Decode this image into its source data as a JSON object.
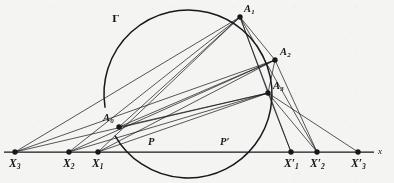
{
  "figure": {
    "background_color": "#f4f4f2",
    "ink_color": "#17181a",
    "circle": {
      "label": "Γ",
      "center_x": 188,
      "center_y": 94,
      "radius": 84,
      "gap_start_deg": 150,
      "gap_end_deg": 171
    },
    "axis": {
      "label": "x",
      "y": 152,
      "x_start": 4,
      "x_end": 374
    },
    "points": [
      {
        "id": "A0",
        "label": "A",
        "sub": "0",
        "x": 119,
        "y": 127,
        "dot": true,
        "label_dx": -16,
        "label_dy": -14,
        "cls": "l-A"
      },
      {
        "id": "A1",
        "label": "A",
        "sub": "1",
        "x": 240,
        "y": 17,
        "dot": true,
        "label_dx": 4,
        "label_dy": -13,
        "cls": "l-A"
      },
      {
        "id": "A2",
        "label": "A",
        "sub": "2",
        "x": 275,
        "y": 60,
        "dot": true,
        "label_dx": 5,
        "label_dy": -13,
        "cls": "l-A"
      },
      {
        "id": "A3",
        "label": "A",
        "sub": "3",
        "x": 268,
        "y": 93,
        "dot": true,
        "label_dx": 5,
        "label_dy": -12,
        "cls": "l-A"
      },
      {
        "id": "X3",
        "label": "X",
        "sub": "3",
        "x": 15,
        "y": 152,
        "dot": true,
        "label_dx": -6,
        "label_dy": 6,
        "cls": "l-X"
      },
      {
        "id": "X2",
        "label": "X",
        "sub": "2",
        "x": 69,
        "y": 152,
        "dot": true,
        "label_dx": -6,
        "label_dy": 6,
        "cls": "l-X"
      },
      {
        "id": "X1",
        "label": "X",
        "sub": "1",
        "x": 98,
        "y": 152,
        "dot": true,
        "label_dx": -6,
        "label_dy": 6,
        "cls": "l-X"
      },
      {
        "id": "X1p",
        "label": "X",
        "sub": "1",
        "prime": "′",
        "x": 291,
        "y": 152,
        "dot": true,
        "label_dx": -7,
        "label_dy": 6,
        "cls": "l-X"
      },
      {
        "id": "X2p",
        "label": "X",
        "sub": "2",
        "prime": "′",
        "x": 317,
        "y": 152,
        "dot": true,
        "label_dx": -7,
        "label_dy": 6,
        "cls": "l-X"
      },
      {
        "id": "X3p",
        "label": "X",
        "sub": "3",
        "prime": "′",
        "x": 358,
        "y": 152,
        "dot": true,
        "label_dx": -7,
        "label_dy": 6,
        "cls": "l-X"
      },
      {
        "id": "P",
        "label": "P",
        "x": 152,
        "y": 152,
        "dot": false,
        "label_dx": -4,
        "label_dy": -15,
        "cls": "l-P"
      },
      {
        "id": "Pp",
        "label": "P",
        "prime": "′",
        "x": 225,
        "y": 152,
        "dot": false,
        "label_dx": -5,
        "label_dy": -15,
        "cls": "l-P"
      }
    ],
    "gamma_label": {
      "text": "Γ",
      "x": 112,
      "y": 14
    },
    "axis_label": {
      "text": "x",
      "x": 378,
      "y": 147
    },
    "segments": [
      {
        "name": "X3-to-A1",
        "x1": 15,
        "y1": 152,
        "x2": 240,
        "y2": 17
      },
      {
        "name": "X2-to-A1",
        "x1": 69,
        "y1": 152,
        "x2": 240,
        "y2": 17
      },
      {
        "name": "X1-to-A1",
        "x1": 98,
        "y1": 152,
        "x2": 240,
        "y2": 17
      },
      {
        "name": "X3-to-A2",
        "x1": 15,
        "y1": 152,
        "x2": 275,
        "y2": 60
      },
      {
        "name": "X2-to-A2",
        "x1": 69,
        "y1": 152,
        "x2": 275,
        "y2": 60
      },
      {
        "name": "X1-to-A2",
        "x1": 98,
        "y1": 152,
        "x2": 275,
        "y2": 60
      },
      {
        "name": "X3-to-A3",
        "x1": 15,
        "y1": 152,
        "x2": 268,
        "y2": 93
      },
      {
        "name": "X2-to-A3",
        "x1": 69,
        "y1": 152,
        "x2": 268,
        "y2": 93
      },
      {
        "name": "X1-to-A3",
        "x1": 98,
        "y1": 152,
        "x2": 268,
        "y2": 93
      },
      {
        "name": "A0-to-A1",
        "x1": 119,
        "y1": 127,
        "x2": 240,
        "y2": 17
      },
      {
        "name": "A0-to-A2",
        "x1": 119,
        "y1": 127,
        "x2": 275,
        "y2": 60
      },
      {
        "name": "A0-to-A3",
        "x1": 119,
        "y1": 127,
        "x2": 268,
        "y2": 93
      },
      {
        "name": "A1-to-A2",
        "x1": 240,
        "y1": 17,
        "x2": 275,
        "y2": 60
      },
      {
        "name": "A1-to-A3",
        "x1": 240,
        "y1": 17,
        "x2": 268,
        "y2": 93
      },
      {
        "name": "A2-to-A3",
        "x1": 275,
        "y1": 60,
        "x2": 268,
        "y2": 93
      },
      {
        "name": "A1-to-X1p",
        "x1": 240,
        "y1": 17,
        "x2": 291,
        "y2": 152
      },
      {
        "name": "A1-to-X2p",
        "x1": 240,
        "y1": 17,
        "x2": 317,
        "y2": 152
      },
      {
        "name": "A2-to-X2p",
        "x1": 275,
        "y1": 60,
        "x2": 317,
        "y2": 152
      },
      {
        "name": "A3-to-X1p",
        "x1": 268,
        "y1": 93,
        "x2": 291,
        "y2": 152
      },
      {
        "name": "A3-to-X2p",
        "x1": 268,
        "y1": 93,
        "x2": 317,
        "y2": 152
      },
      {
        "name": "A3-to-X3p",
        "x1": 268,
        "y1": 93,
        "x2": 358,
        "y2": 152
      }
    ]
  }
}
